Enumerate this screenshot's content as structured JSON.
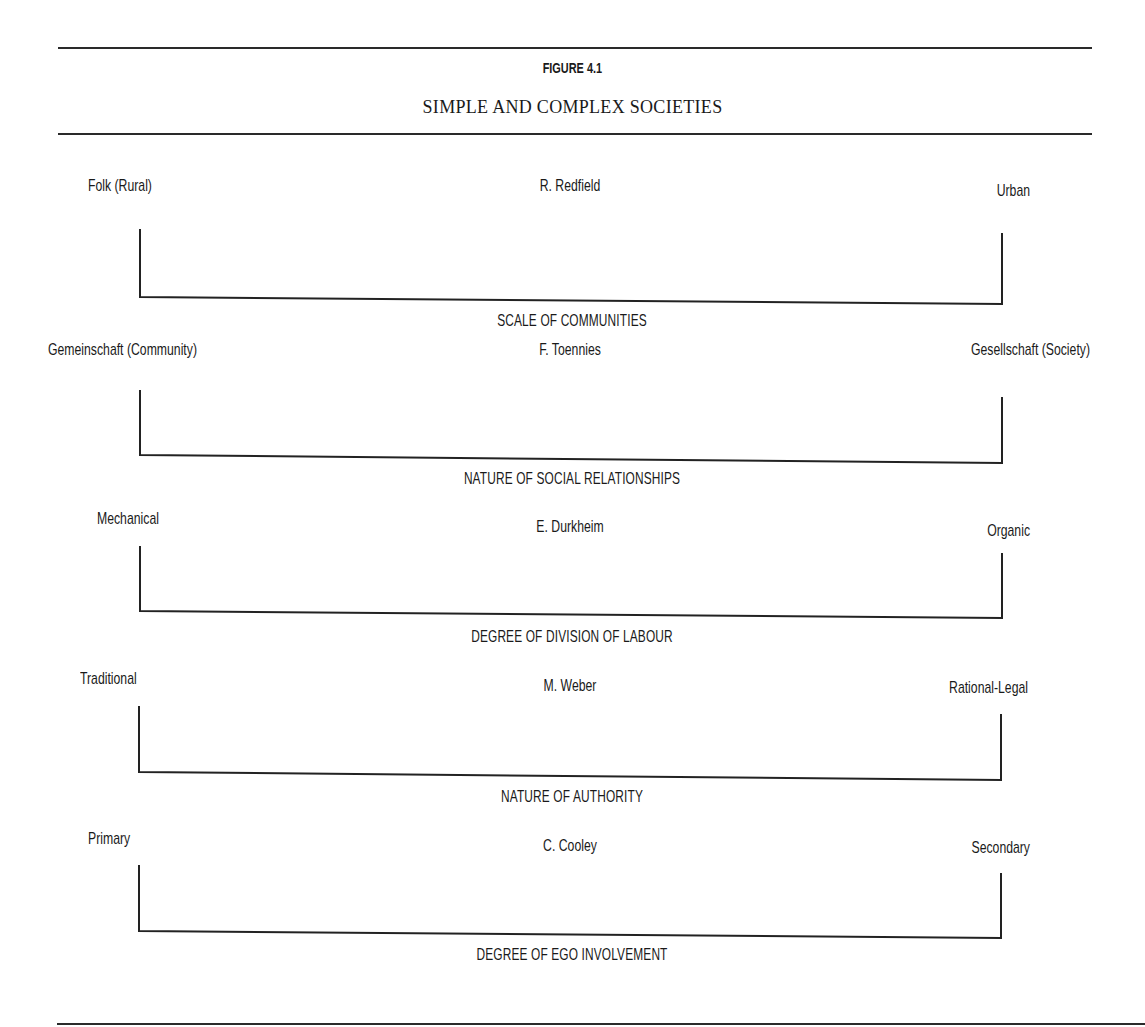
{
  "figure": {
    "number": "FIGURE 4.1",
    "title": "SIMPLE AND COMPLEX SOCIETIES"
  },
  "continua": [
    {
      "left_pole": "Folk (Rural)",
      "theorist": "R. Redfield",
      "right_pole": "Urban",
      "dimension": "SCALE OF COMMUNITIES"
    },
    {
      "left_pole": "Gemeinschaft (Community)",
      "theorist": "F. Toennies",
      "right_pole": "Gesellschaft (Society)",
      "dimension": "NATURE OF SOCIAL RELATIONSHIPS"
    },
    {
      "left_pole": "Mechanical",
      "theorist": "E. Durkheim",
      "right_pole": "Organic",
      "dimension": "DEGREE OF DIVISION OF LABOUR"
    },
    {
      "left_pole": "Traditional",
      "theorist": "M. Weber",
      "right_pole": "Rational-Legal",
      "dimension": "NATURE OF AUTHORITY"
    },
    {
      "left_pole": "Primary",
      "theorist": "C. Cooley",
      "right_pole": "Secondary",
      "dimension": "DEGREE OF EGO INVOLVEMENT"
    }
  ],
  "colors": {
    "ink": "#1a1a1a",
    "rule": "#2a2a2a",
    "paper": "#ffffff"
  }
}
